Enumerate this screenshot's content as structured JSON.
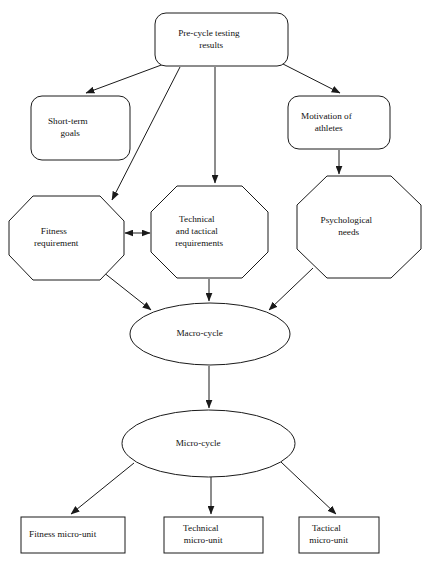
{
  "diagram": {
    "stroke_color": "#1a1a1a",
    "fill_color": "#ffffff",
    "text_color": "#111111",
    "nodes": [
      {
        "id": "pre-cycle-testing-results",
        "shape": "rounded-rectangle",
        "lines": [
          "Pre-cycle testing",
          "results"
        ],
        "x": 155,
        "y": 13,
        "w": 133,
        "h": 53,
        "rx": 11
      },
      {
        "id": "short-term-goals",
        "shape": "rounded-rectangle",
        "lines": [
          "Short-term",
          "goals"
        ],
        "x": 31,
        "y": 96,
        "w": 99,
        "h": 64,
        "rx": 11
      },
      {
        "id": "motivation-of-athletes",
        "shape": "rounded-rectangle",
        "lines": [
          "Motivation of",
          "athletes"
        ],
        "x": 288,
        "y": 96,
        "w": 102,
        "h": 53,
        "rx": 11
      },
      {
        "id": "fitness-requirement",
        "shape": "octagon",
        "lines": [
          "Fitness",
          "requirement"
        ],
        "x": 9,
        "y": 196,
        "w": 115,
        "h": 84
      },
      {
        "id": "technical-and-tactical-requirements",
        "shape": "octagon",
        "lines": [
          "Technical",
          "and tactical",
          "requirements"
        ],
        "x": 151,
        "y": 186,
        "w": 117,
        "h": 92
      },
      {
        "id": "psychological-needs",
        "shape": "octagon",
        "lines": [
          "Psychological",
          "needs"
        ],
        "x": 297,
        "y": 176,
        "w": 124,
        "h": 102
      },
      {
        "id": "macro-cycle",
        "shape": "ellipse",
        "lines": [
          "Macro-cycle"
        ],
        "x": 130,
        "y": 303,
        "w": 160,
        "h": 62
      },
      {
        "id": "micro-cycle",
        "shape": "ellipse",
        "lines": [
          "Micro-cycle"
        ],
        "x": 122,
        "y": 410,
        "w": 173,
        "h": 67
      },
      {
        "id": "fitness-micro-unit",
        "shape": "rectangle",
        "lines": [
          "Fitness micro-unit"
        ],
        "x": 21,
        "y": 517,
        "w": 104,
        "h": 36
      },
      {
        "id": "technical-micro-unit",
        "shape": "rectangle",
        "lines": [
          "Technical",
          "micro-unit"
        ],
        "x": 164,
        "y": 517,
        "w": 99,
        "h": 36
      },
      {
        "id": "tactical-micro-unit",
        "shape": "rectangle",
        "lines": [
          "Tactical",
          "micro-unit"
        ],
        "x": 299,
        "y": 517,
        "w": 80,
        "h": 36
      }
    ],
    "edges": [
      {
        "id": "edge-testing-to-short-term-goals",
        "from": "pre-cycle-testing-results",
        "to": "short-term-goals",
        "arrow": "single"
      },
      {
        "id": "edge-testing-to-motivation",
        "from": "pre-cycle-testing-results",
        "to": "motivation-of-athletes",
        "arrow": "single"
      },
      {
        "id": "edge-testing-to-fitness",
        "from": "pre-cycle-testing-results",
        "to": "fitness-requirement",
        "arrow": "single"
      },
      {
        "id": "edge-testing-to-technical",
        "from": "pre-cycle-testing-results",
        "to": "technical-and-tactical-requirements",
        "arrow": "single"
      },
      {
        "id": "edge-motivation-to-psychological",
        "from": "motivation-of-athletes",
        "to": "psychological-needs",
        "arrow": "single"
      },
      {
        "id": "edge-fitness-technical-bidirectional",
        "from": "fitness-requirement",
        "to": "technical-and-tactical-requirements",
        "arrow": "double"
      },
      {
        "id": "edge-fitness-to-macro",
        "from": "fitness-requirement",
        "to": "macro-cycle",
        "arrow": "single"
      },
      {
        "id": "edge-technical-to-macro",
        "from": "technical-and-tactical-requirements",
        "to": "macro-cycle",
        "arrow": "single"
      },
      {
        "id": "edge-psychological-to-macro",
        "from": "psychological-needs",
        "to": "macro-cycle",
        "arrow": "single"
      },
      {
        "id": "edge-macro-to-micro",
        "from": "macro-cycle",
        "to": "micro-cycle",
        "arrow": "single"
      },
      {
        "id": "edge-micro-to-fitness-unit",
        "from": "micro-cycle",
        "to": "fitness-micro-unit",
        "arrow": "single"
      },
      {
        "id": "edge-micro-to-technical-unit",
        "from": "micro-cycle",
        "to": "technical-micro-unit",
        "arrow": "single"
      },
      {
        "id": "edge-micro-to-tactical-unit",
        "from": "micro-cycle",
        "to": "tactical-micro-unit",
        "arrow": "single"
      }
    ]
  }
}
